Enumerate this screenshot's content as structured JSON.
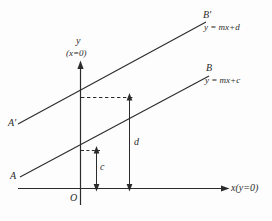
{
  "figure": {
    "background_color": "#fdfdfd",
    "stroke_color": "#2b2b2b"
  },
  "axes": {
    "y_axis": {
      "label": "y",
      "condition": "(x=0)",
      "arrow": "up-arrow-icon"
    },
    "x_axis": {
      "label": "x(y=0)",
      "arrow": "right-arrow-icon"
    },
    "origin": {
      "label": "O"
    }
  },
  "lines": [
    {
      "name": "upper-line",
      "start_label": "A'",
      "end_label": "B'",
      "equation": "y = mx+d"
    },
    {
      "name": "lower-line",
      "start_label": "A",
      "end_label": "B",
      "equation": "y = mx+c"
    }
  ],
  "measures": [
    {
      "name": "intercept-c",
      "label": "c",
      "arrow": "double-headed-vertical-arrow-icon"
    },
    {
      "name": "intercept-d",
      "label": "d",
      "arrow": "double-headed-vertical-arrow-icon"
    }
  ],
  "guides": [
    {
      "name": "horizontal-dashed-guide",
      "style": "dashed"
    },
    {
      "name": "short-dashed-tick",
      "style": "dashed"
    }
  ]
}
